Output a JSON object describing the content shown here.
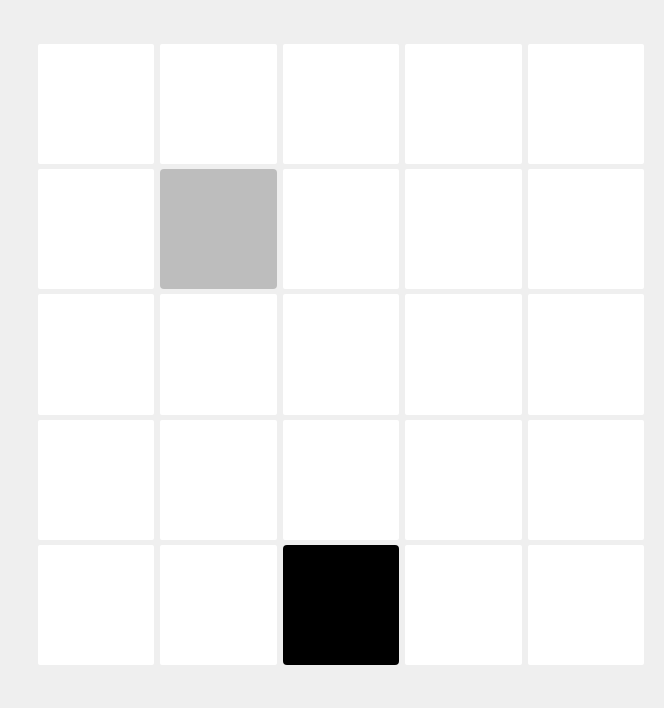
{
  "board": {
    "rows": 5,
    "cols": 5,
    "colors": {
      "background": "#efefef",
      "empty": "#ffffff",
      "gray": "#bdbdbd",
      "black": "#000000"
    },
    "cells": [
      [
        "empty",
        "empty",
        "empty",
        "empty",
        "empty"
      ],
      [
        "empty",
        "gray",
        "empty",
        "empty",
        "empty"
      ],
      [
        "empty",
        "empty",
        "empty",
        "empty",
        "empty"
      ],
      [
        "empty",
        "empty",
        "empty",
        "empty",
        "empty"
      ],
      [
        "empty",
        "empty",
        "black",
        "empty",
        "empty"
      ]
    ]
  }
}
